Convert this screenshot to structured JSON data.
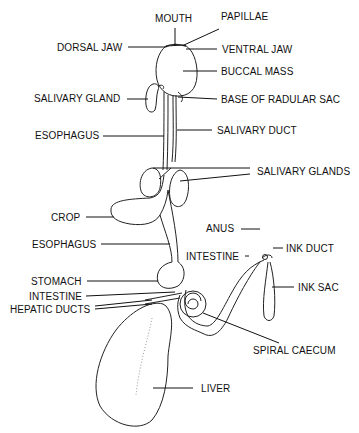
{
  "diagram": {
    "type": "anatomical-diagram",
    "stroke_color": "#222222",
    "background": "#ffffff",
    "labels": {
      "mouth": "MOUTH",
      "papillae": "PAPILLAE",
      "dorsal_jaw": "DORSAL JAW",
      "ventral_jaw": "VENTRAL JAW",
      "buccal_mass": "BUCCAL MASS",
      "salivary_gland": "SALIVARY GLAND",
      "base_of_radular_sac": "BASE OF RADULAR SAC",
      "esophagus_upper": "ESOPHAGUS",
      "salivary_duct": "SALIVARY DUCT",
      "salivary_glands": "SALIVARY GLANDS",
      "crop": "CROP",
      "anus": "ANUS",
      "esophagus_lower": "ESOPHAGUS",
      "intestine_right": "INTESTINE",
      "ink_duct": "INK DUCT",
      "stomach": "STOMACH",
      "ink_sac": "INK SAC",
      "intestine_left": "INTESTINE",
      "hepatic_ducts": "HEPATIC DUCTS",
      "spiral_caecum": "SPIRAL CAECUM",
      "liver": "LIVER"
    }
  }
}
